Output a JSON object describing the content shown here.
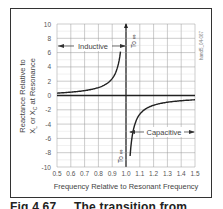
{
  "chart_data": {
    "type": "line",
    "title": "",
    "xlabel": "Frequency Relative to Resonant Frequency",
    "ylabel_line1": "Reactance Relative to",
    "ylabel_line2": "XL or XC at Resonance",
    "xlim": [
      0.5,
      1.5
    ],
    "ylim": [
      -10,
      10
    ],
    "grid": true,
    "x_ticks": [
      "0.5",
      "0.6",
      "0.7",
      "0.8",
      "0.9",
      "1.0",
      "1.1",
      "1.2",
      "1.3",
      "1.4",
      "1.5"
    ],
    "y_ticks": [
      "10",
      "8",
      "6",
      "4",
      "2",
      "0",
      "-2",
      "-4",
      "-6",
      "-8",
      "-10"
    ],
    "series": [
      {
        "name": "Inductive",
        "description": "Reactance rising toward +infinity as frequency approaches 1.0 from below",
        "x": [
          0.5,
          0.6,
          0.7,
          0.8,
          0.9,
          0.95,
          0.97
        ],
        "y": [
          0.67,
          0.94,
          1.37,
          2.22,
          4.74,
          9.74,
          10
        ]
      },
      {
        "name": "Capacitive",
        "description": "Reactance rising from -infinity just above 1.0 toward about -1 at 1.5",
        "x": [
          1.03,
          1.05,
          1.1,
          1.2,
          1.3,
          1.4,
          1.5
        ],
        "y": [
          -10,
          -10.2,
          -5.24,
          -2.73,
          -1.9,
          -1.46,
          -1.2
        ]
      }
    ],
    "annotations": [
      {
        "text": "Inductive",
        "position": "upper-left region, arrows spanning 0.5 to 1.0"
      },
      {
        "text": "Capacitive",
        "position": "lower-right region, arrows spanning 1.0 to 1.5"
      },
      {
        "text": "To ∞",
        "position": "vertical, near x=1.0 top"
      },
      {
        "text": "To ∞",
        "position": "vertical, near x=1.0 bottom"
      }
    ],
    "figure_id": "hand5_04-067"
  },
  "labels": {
    "inductive": "Inductive",
    "capacitive": "Capacitive",
    "to_inf_top": "To ∞",
    "to_inf_bottom": "To ∞",
    "figure_id": "hand5_04-067",
    "x_axis_title": "Frequency Relative to Resonant Frequency",
    "y_axis_line1": "Reactance Relative to",
    "y_axis_line2": "XL or XC at Resonance"
  },
  "caption": {
    "fig": "Fig 4.67",
    "text": "The transition from"
  }
}
